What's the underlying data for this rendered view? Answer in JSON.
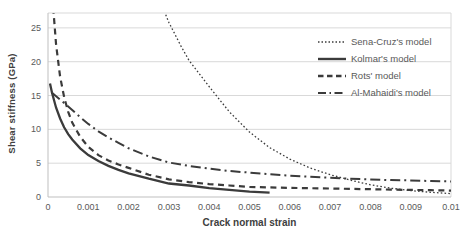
{
  "chart_data": {
    "type": "line",
    "title": "",
    "xlabel": "Crack normal strain",
    "ylabel": "Shear stiffness (GPa)",
    "xlim": [
      0,
      0.01
    ],
    "ylim": [
      0,
      27.2
    ],
    "grid": "horizontal",
    "legend_position": "inside-top-right",
    "colors": {
      "line": "#3b3b3b",
      "grid": "#d9d9d9",
      "border": "#d9d9d9",
      "axis": "#bfbfbf",
      "tick_text": "#595959",
      "title_text": "#404040",
      "background": "#ffffff"
    },
    "xticks": {
      "values": [
        0,
        0.001,
        0.002,
        0.003,
        0.004,
        0.005,
        0.006,
        0.007,
        0.008,
        0.009,
        0.01
      ],
      "labels": [
        "0",
        "0.001",
        "0.002",
        "0.003",
        "0.004",
        "0.005",
        "0.006",
        "0.007",
        "0.008",
        "0.009",
        "0.01"
      ]
    },
    "yticks": {
      "values": [
        0,
        5,
        10,
        15,
        20,
        25
      ],
      "labels": [
        "0",
        "5",
        "10",
        "15",
        "20",
        "25"
      ]
    },
    "series": [
      {
        "name": "Sena-Cruz's model",
        "line_style": "dotted",
        "x": [
          0.00285,
          0.003,
          0.0033,
          0.0035,
          0.004,
          0.0045,
          0.005,
          0.0055,
          0.006,
          0.0065,
          0.007,
          0.0075,
          0.008,
          0.0085,
          0.009,
          0.0095,
          0.01
        ],
        "y": [
          28,
          25.8,
          22.3,
          20.2,
          16.3,
          12.6,
          9.6,
          7.3,
          5.6,
          4.3,
          3.3,
          2.5,
          1.8,
          1.3,
          0.95,
          0.7,
          0.5
        ]
      },
      {
        "name": "Kolmar's model",
        "line_style": "solid",
        "x": [
          5e-05,
          0.0001,
          0.0002,
          0.0003,
          0.0004,
          0.0005,
          0.0006,
          0.0008,
          0.001,
          0.00125,
          0.0015,
          0.00175,
          0.002,
          0.0025,
          0.003,
          0.0035,
          0.004,
          0.0045,
          0.005,
          0.0055
        ],
        "y": [
          16.8,
          15.4,
          13.2,
          11.6,
          10.3,
          9.3,
          8.5,
          7.2,
          6.2,
          5.3,
          4.6,
          4.0,
          3.5,
          2.7,
          2.0,
          1.7,
          1.3,
          1.05,
          0.8,
          0.65
        ]
      },
      {
        "name": "Rots' model",
        "line_style": "dashed",
        "x": [
          0.00013,
          0.0002,
          0.0003,
          0.0004,
          0.0005,
          0.0006,
          0.0008,
          0.001,
          0.00125,
          0.0015,
          0.00175,
          0.002,
          0.0025,
          0.003,
          0.0035,
          0.004,
          0.0045,
          0.005,
          0.0055,
          0.006,
          0.0065,
          0.007,
          0.0075,
          0.008,
          0.0085,
          0.009,
          0.0095,
          0.01
        ],
        "y": [
          28,
          22.5,
          17.8,
          14.8,
          12.6,
          11.0,
          8.9,
          7.4,
          6.2,
          5.4,
          4.8,
          4.3,
          3.3,
          2.6,
          2.2,
          1.9,
          1.7,
          1.5,
          1.42,
          1.35,
          1.3,
          1.25,
          1.2,
          1.15,
          1.1,
          1.05,
          1.0,
          0.95
        ]
      },
      {
        "name": "Al-Mahaidi's model",
        "line_style": "dashdot",
        "x": [
          0.0001,
          0.0002,
          0.0003,
          0.0004,
          0.0005,
          0.00065,
          0.0008,
          0.001,
          0.00125,
          0.0015,
          0.00175,
          0.002,
          0.0025,
          0.003,
          0.0035,
          0.004,
          0.0045,
          0.005,
          0.0055,
          0.006,
          0.0065,
          0.007,
          0.0075,
          0.008,
          0.0085,
          0.009,
          0.0095,
          0.01
        ],
        "y": [
          15.4,
          14.9,
          14.4,
          13.9,
          13.4,
          12.6,
          11.8,
          10.8,
          9.7,
          8.8,
          8.0,
          7.2,
          6.0,
          5.1,
          4.6,
          4.2,
          3.85,
          3.6,
          3.35,
          3.15,
          3.0,
          2.85,
          2.7,
          2.6,
          2.5,
          2.45,
          2.35,
          2.3
        ]
      }
    ]
  }
}
